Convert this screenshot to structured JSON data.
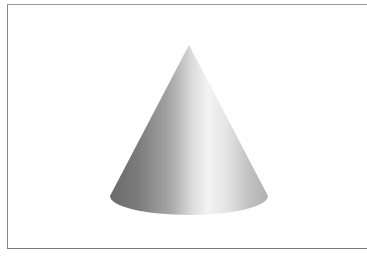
{
  "figure": {
    "colors": {
      "background": "#ffffff",
      "frame": "#8a8a8a",
      "shade_dark": "#6e6e6e",
      "shade_mid": "#a8a8a8",
      "highlight": "#f2f2f2",
      "shade_right": "#b4b4b4"
    },
    "cone": {
      "apex": [
        189,
        45
      ],
      "base_center": [
        189,
        198
      ],
      "base_rx": 79,
      "base_ry": 19
    }
  }
}
